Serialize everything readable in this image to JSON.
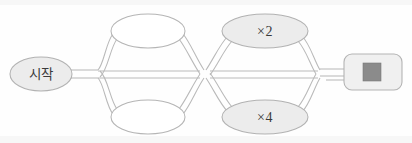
{
  "diagram": {
    "background_color": "#fefefe",
    "stroke_color": "#b5b5b5",
    "shaded_fill": "#ececec",
    "plain_fill": "#ffffff",
    "end_square_color": "#8b8b8b",
    "nodes": [
      {
        "id": "start",
        "label": "시작",
        "shape": "ellipse",
        "fill": "shaded",
        "cx": 41,
        "cy": 74,
        "rx": 31,
        "ry": 17
      },
      {
        "id": "upper-left",
        "label": "",
        "shape": "ellipse",
        "fill": "plain",
        "cx": 148,
        "cy": 31,
        "rx": 37,
        "ry": 17
      },
      {
        "id": "lower-left",
        "label": "",
        "shape": "ellipse",
        "fill": "plain",
        "cx": 148,
        "cy": 117,
        "rx": 37,
        "ry": 17
      },
      {
        "id": "upper-right",
        "label": "×2",
        "shape": "ellipse",
        "fill": "shaded",
        "cx": 265,
        "cy": 31,
        "rx": 43,
        "ry": 17
      },
      {
        "id": "lower-right",
        "label": "×4",
        "shape": "ellipse",
        "fill": "shaded",
        "cx": 265,
        "cy": 117,
        "rx": 43,
        "ry": 17
      },
      {
        "id": "end",
        "label": "",
        "shape": "rounded-rectangle",
        "fill": "shaded",
        "x": 344,
        "y": 54,
        "width": 58,
        "height": 36,
        "icon": "stop-square"
      }
    ],
    "crossing": {
      "id": "center-crossing",
      "x": 205,
      "y": 74
    }
  }
}
